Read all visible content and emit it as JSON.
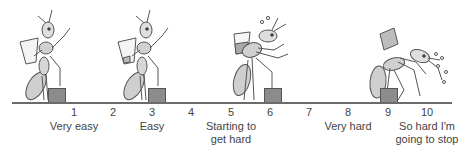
{
  "scale": {
    "ticks": [
      {
        "num": "1",
        "x": 74,
        "label": "Very easy"
      },
      {
        "num": "2",
        "x": 113,
        "label": ""
      },
      {
        "num": "3",
        "x": 152,
        "label": "Easy"
      },
      {
        "num": "4",
        "x": 191,
        "label": ""
      },
      {
        "num": "5",
        "x": 231,
        "label": "Starting to\nget hard"
      },
      {
        "num": "6",
        "x": 270,
        "label": ""
      },
      {
        "num": "7",
        "x": 309,
        "label": ""
      },
      {
        "num": "8",
        "x": 348,
        "label": "Very hard"
      },
      {
        "num": "9",
        "x": 388,
        "label": ""
      },
      {
        "num": "10",
        "x": 427,
        "label": "So hard I'm\ngoing to stop"
      }
    ]
  },
  "figures": [
    {
      "name": "ant-very-easy",
      "level": "1",
      "description": "Ant standing upright lifting empty glass onto box"
    },
    {
      "name": "ant-easy",
      "level": "3",
      "description": "Ant holding glass with small load, standing upright"
    },
    {
      "name": "ant-starting-hard",
      "level": "5-6",
      "description": "Ant leaning, carrying fuller glass, sweat drops"
    },
    {
      "name": "ant-very-hard",
      "level": "9",
      "description": "Ant bent over, heavy glass, sweating and panting"
    }
  ],
  "colors": {
    "line": "#6b6b6b",
    "box": "#8c8c8c",
    "ant_fill": "#d9d9d9",
    "ant_stroke": "#555555"
  }
}
